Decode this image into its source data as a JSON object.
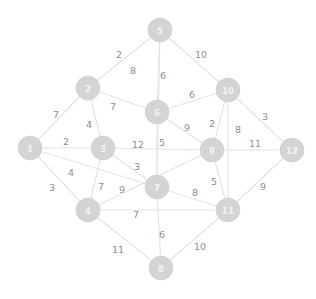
{
  "graph": {
    "title": "weighted-undirected-graph",
    "node_count": 12,
    "edge_count": 26,
    "colors": {
      "node_fill": "#d4d4d4",
      "node_label": "#f2f2f2",
      "edge_stroke": "#e3e3e3",
      "weight_text": "#8e8e8e",
      "background": "#ffffff"
    },
    "nodes": [
      {
        "id": "1",
        "label": "1",
        "x": 30,
        "y": 148,
        "r": 12
      },
      {
        "id": "2",
        "label": "2",
        "x": 88,
        "y": 88,
        "r": 12
      },
      {
        "id": "3",
        "label": "3",
        "x": 103,
        "y": 148,
        "r": 12
      },
      {
        "id": "4",
        "label": "4",
        "x": 88,
        "y": 210,
        "r": 12
      },
      {
        "id": "5",
        "label": "5",
        "x": 160,
        "y": 30,
        "r": 12
      },
      {
        "id": "6",
        "label": "6",
        "x": 157,
        "y": 112,
        "r": 12
      },
      {
        "id": "7",
        "label": "7",
        "x": 157,
        "y": 187,
        "r": 12
      },
      {
        "id": "8",
        "label": "8",
        "x": 161,
        "y": 268,
        "r": 12
      },
      {
        "id": "9",
        "label": "9",
        "x": 212,
        "y": 150,
        "r": 12
      },
      {
        "id": "10",
        "label": "10",
        "x": 228,
        "y": 90,
        "r": 12
      },
      {
        "id": "11",
        "label": "11",
        "x": 228,
        "y": 210,
        "r": 12
      },
      {
        "id": "12",
        "label": "12",
        "x": 292,
        "y": 150,
        "r": 12
      }
    ],
    "edges": [
      {
        "source": "5",
        "target": "2",
        "weight": "2",
        "lx": 119,
        "ly": 54
      },
      {
        "source": "5",
        "target": "7",
        "weight": "8",
        "lx": 133,
        "ly": 70
      },
      {
        "source": "5",
        "target": "6",
        "weight": "6",
        "lx": 163,
        "ly": 75
      },
      {
        "source": "5",
        "target": "10",
        "weight": "10",
        "lx": 201,
        "ly": 54
      },
      {
        "source": "2",
        "target": "1",
        "weight": "7",
        "lx": 56,
        "ly": 114
      },
      {
        "source": "2",
        "target": "3",
        "weight": "4",
        "lx": 89,
        "ly": 124
      },
      {
        "source": "2",
        "target": "6",
        "weight": "7",
        "lx": 113,
        "ly": 106
      },
      {
        "source": "1",
        "target": "3",
        "weight": "2",
        "lx": 66,
        "ly": 141
      },
      {
        "source": "1",
        "target": "4",
        "weight": "3",
        "lx": 52,
        "ly": 187
      },
      {
        "source": "1",
        "target": "7",
        "weight": "4",
        "lx": 71,
        "ly": 172
      },
      {
        "source": "3",
        "target": "4",
        "weight": "7",
        "lx": 101,
        "ly": 186
      },
      {
        "source": "3",
        "target": "9",
        "weight": "12",
        "lx": 138,
        "ly": 144
      },
      {
        "source": "3",
        "target": "7",
        "weight": "3",
        "lx": 137,
        "ly": 166
      },
      {
        "source": "6",
        "target": "10",
        "weight": "6",
        "lx": 192,
        "ly": 94
      },
      {
        "source": "6",
        "target": "9",
        "weight": "9",
        "lx": 187,
        "ly": 127
      },
      {
        "source": "6",
        "target": "7",
        "weight": "5",
        "lx": 162,
        "ly": 142
      },
      {
        "source": "10",
        "target": "9",
        "weight": "2",
        "lx": 212,
        "ly": 123
      },
      {
        "source": "10",
        "target": "11",
        "weight": "8",
        "lx": 238,
        "ly": 129
      },
      {
        "source": "10",
        "target": "12",
        "weight": "3",
        "lx": 265,
        "ly": 116
      },
      {
        "source": "9",
        "target": "12",
        "weight": "11",
        "lx": 255,
        "ly": 143
      },
      {
        "source": "9",
        "target": "11",
        "weight": "5",
        "lx": 214,
        "ly": 181
      },
      {
        "source": "7",
        "target": "11",
        "weight": "8",
        "lx": 195,
        "ly": 192
      },
      {
        "source": "7",
        "target": "8",
        "weight": "6",
        "lx": 162,
        "ly": 234
      },
      {
        "source": "4",
        "target": "11",
        "weight": "7",
        "lx": 136,
        "ly": 214
      },
      {
        "source": "4",
        "target": "8",
        "weight": "11",
        "lx": 118,
        "ly": 249
      },
      {
        "source": "8",
        "target": "11",
        "weight": "10",
        "lx": 200,
        "ly": 246
      },
      {
        "source": "12",
        "target": "11",
        "weight": "9",
        "lx": 263,
        "ly": 186
      },
      {
        "source": "4",
        "target": "9",
        "weight": "9",
        "lx": 122,
        "ly": 189
      }
    ]
  }
}
